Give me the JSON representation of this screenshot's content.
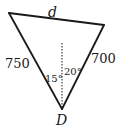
{
  "diagram": {
    "type": "triangle",
    "vertices": {
      "top_left": {
        "x": 9,
        "y": 13
      },
      "top_right": {
        "x": 104,
        "y": 25
      },
      "bottom": {
        "x": 62,
        "y": 109
      }
    },
    "labels": {
      "top_side": "d",
      "left_side": "750",
      "right_side": "700",
      "bottom_vertex": "D",
      "left_angle": "15°",
      "right_angle": "20°"
    },
    "colors": {
      "stroke": "#1a1a1a",
      "background": "#ffffff"
    }
  }
}
